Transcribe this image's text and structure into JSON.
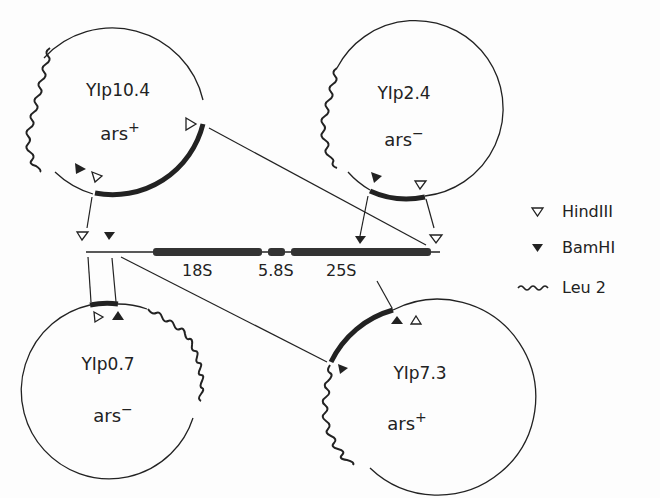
{
  "figure": {
    "type": "plasmid restriction map diagram",
    "colors": {
      "ink": "#222222",
      "background": "#fdfdfd"
    }
  },
  "plasmids": [
    {
      "name": "YIp10.4",
      "ars": "ars",
      "ars_sign": "+"
    },
    {
      "name": "YIp2.4",
      "ars": "ars",
      "ars_sign": "−"
    },
    {
      "name": "YIp0.7",
      "ars": "ars",
      "ars_sign": "−"
    },
    {
      "name": "YIp7.3",
      "ars": "ars",
      "ars_sign": "+"
    }
  ],
  "rdna": {
    "genes": [
      {
        "label": "18S"
      },
      {
        "label": "5.8S"
      },
      {
        "label": "25S"
      }
    ]
  },
  "legend": [
    {
      "symbol": "open-triangle",
      "label": "HindIII"
    },
    {
      "symbol": "filled-triangle",
      "label": "BamHI"
    },
    {
      "symbol": "wavy-line",
      "label": "Leu 2"
    }
  ]
}
